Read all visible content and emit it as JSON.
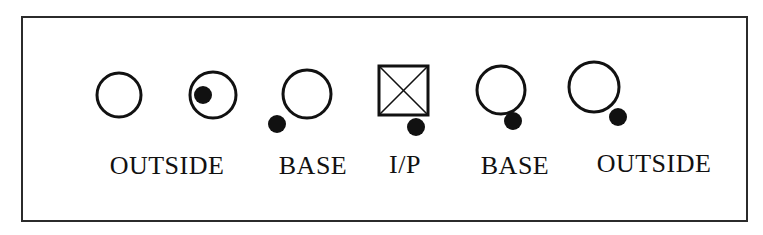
{
  "figure": {
    "background_color": "#ffffff",
    "frame": {
      "border_color": "#2b2b2b",
      "border_width_px": 2,
      "x": 21,
      "y": 16,
      "width": 727,
      "height": 206
    },
    "stroke_color": "#111111",
    "fill_color": "#111111"
  },
  "nodes": [
    {
      "id": "node-1",
      "shape": "circle",
      "label": "OUTSIDE",
      "label_x": 167,
      "label_y": 153,
      "label_size": 26,
      "cx": 119,
      "cy": 95,
      "r": 22,
      "stroke_width": 3,
      "dot": null
    },
    {
      "id": "node-2",
      "shape": "circle",
      "label": "",
      "label_x": 0,
      "label_y": 0,
      "label_size": 26,
      "cx": 213,
      "cy": 95,
      "r": 23,
      "stroke_width": 3,
      "dot": {
        "cx": 203,
        "cy": 95,
        "r": 9
      }
    },
    {
      "id": "node-3",
      "shape": "circle",
      "label": "BASE",
      "label_x": 313,
      "label_y": 153,
      "label_size": 26,
      "cx": 307,
      "cy": 94,
      "r": 24,
      "stroke_width": 3,
      "dot": {
        "cx": 277,
        "cy": 124,
        "r": 9
      }
    },
    {
      "id": "node-4",
      "shape": "crossed-square",
      "label": "I/P",
      "label_x": 405,
      "label_y": 152,
      "label_size": 26,
      "x": 379,
      "y": 66,
      "width": 49,
      "height": 49,
      "stroke_width": 3,
      "cross_stroke_width": 1.6,
      "dot": {
        "cx": 416,
        "cy": 127,
        "r": 9
      }
    },
    {
      "id": "node-5",
      "shape": "circle",
      "label": "BASE",
      "label_x": 515,
      "label_y": 153,
      "label_size": 26,
      "cx": 501,
      "cy": 90,
      "r": 24,
      "stroke_width": 3,
      "dot": {
        "cx": 513,
        "cy": 121,
        "r": 9
      }
    },
    {
      "id": "node-6",
      "shape": "circle",
      "label": "OUTSIDE",
      "label_x": 654,
      "label_y": 151,
      "label_size": 26,
      "cx": 594,
      "cy": 87,
      "r": 25,
      "stroke_width": 3,
      "dot": {
        "cx": 618,
        "cy": 117,
        "r": 9
      }
    }
  ],
  "labels": [
    {
      "text": "OUTSIDE",
      "x": 167,
      "y": 153,
      "size": 26
    },
    {
      "text": "BASE",
      "x": 313,
      "y": 153,
      "size": 26
    },
    {
      "text": "I/P",
      "x": 405,
      "y": 152,
      "size": 26
    },
    {
      "text": "BASE",
      "x": 515,
      "y": 153,
      "size": 26
    },
    {
      "text": "OUTSIDE",
      "x": 654,
      "y": 151,
      "size": 26
    }
  ]
}
